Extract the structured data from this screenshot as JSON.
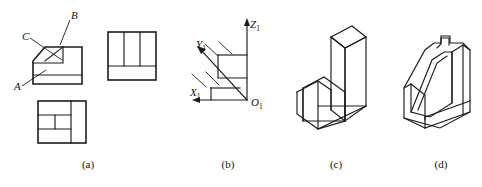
{
  "figure": {
    "line_color": "#1c1c1c",
    "background": "#ffffff"
  },
  "captions": [
    {
      "key": "a",
      "text": "(a)"
    },
    {
      "key": "b",
      "text": "(b)"
    },
    {
      "key": "c",
      "text": "(c)"
    },
    {
      "key": "d",
      "text": "(d)"
    }
  ],
  "panel_a": {
    "name": "orthographic-views",
    "surface_labels": [
      {
        "id": "A",
        "text": "A"
      },
      {
        "id": "B",
        "text": "B"
      },
      {
        "id": "C",
        "text": "C"
      }
    ],
    "views": [
      {
        "id": "front-view",
        "note": "front view with chamfer and step"
      },
      {
        "id": "side-view",
        "note": "side view, three vertical divisions over a base band"
      },
      {
        "id": "top-view",
        "note": "top view, stepped partitions"
      }
    ]
  },
  "panel_b": {
    "name": "axonometric-axes",
    "axes": [
      {
        "id": "X1",
        "label": "X",
        "subscript": "1"
      },
      {
        "id": "Y1",
        "label": "Y",
        "subscript": "1"
      },
      {
        "id": "Z1",
        "label": "Z",
        "subscript": "1"
      }
    ],
    "origin": {
      "id": "O1",
      "label": "O",
      "subscript": "1"
    }
  },
  "panel_c": {
    "name": "solid-option-c",
    "description": "L-shaped block, vertical wall on right, horizontal base plate"
  },
  "panel_d": {
    "name": "solid-option-d",
    "description": "Stepped block with inclined chamfer face and notch"
  }
}
